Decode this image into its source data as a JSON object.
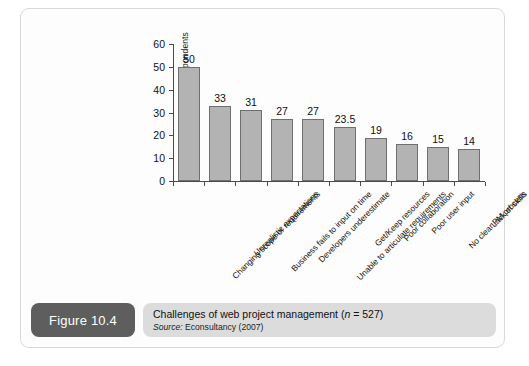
{
  "figure": {
    "number_label": "Figure 10.4",
    "caption_title_prefix": "Challenges of web project management (",
    "caption_title_n": "n",
    "caption_title_suffix": " = 527)",
    "source_prefix": "Source:",
    "source_text": " Econsultancy (2007)"
  },
  "colors": {
    "bar_fill": "#b3b3b3",
    "bar_stroke": "#6f6f6f",
    "axis": "#4a4a4a",
    "figure_box": "#5e5e5e",
    "caption_box": "#dcdcdc",
    "card_bg": "#fdfdfd",
    "card_border": "#d8d8d8"
  },
  "chart_data": {
    "type": "bar",
    "title": "Challenges of web project management (n = 527)",
    "xlabel": "",
    "ylabel": "% of respondents",
    "ylim": [
      0,
      60
    ],
    "yticks": [
      0,
      10,
      20,
      30,
      40,
      50,
      60
    ],
    "ytick_labels": [
      "0",
      "10",
      "20",
      "30",
      "40",
      "50",
      "60"
    ],
    "grid": false,
    "legend": "none",
    "categories": [
      "Changing scope or requirements",
      "Unrealistic expectations",
      "Business fails to input on time",
      "Developers underestimate",
      "Unable to articulate requirements",
      "Get/Keep resources",
      "Poor collaboration",
      "Poor user input",
      "No clear PM process",
      "Lack of skills"
    ],
    "values": [
      50,
      33,
      31,
      27,
      27,
      23.5,
      19,
      16,
      15,
      14
    ],
    "value_labels": [
      "50",
      "33",
      "31",
      "27",
      "27",
      "23.5",
      "19",
      "16",
      "15",
      "14"
    ]
  }
}
